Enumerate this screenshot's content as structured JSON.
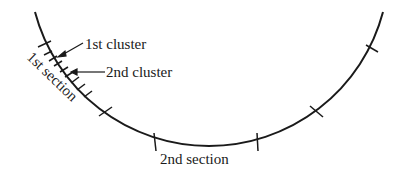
{
  "diagram": {
    "labels": {
      "first_cluster": "1st cluster",
      "second_cluster": "2nd cluster",
      "first_section": "1st section",
      "second_section": "2nd section"
    },
    "colors": {
      "stroke": "#1a1a1a",
      "background": "#ffffff"
    }
  }
}
